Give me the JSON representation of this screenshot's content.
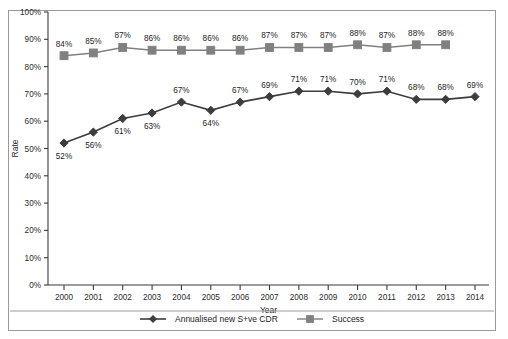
{
  "chart_data": {
    "type": "line",
    "title": "",
    "xlabel": "Year",
    "ylabel": "Rate",
    "categories": [
      "2000",
      "2001",
      "2002",
      "2003",
      "2004",
      "2005",
      "2006",
      "2007",
      "2008",
      "2009",
      "2010",
      "2011",
      "2012",
      "2013",
      "2014"
    ],
    "ylim": [
      0,
      100
    ],
    "ytick_labels": [
      "0%",
      "10%",
      "20%",
      "30%",
      "40%",
      "50%",
      "60%",
      "70%",
      "80%",
      "90%",
      "100%"
    ],
    "ytick_values": [
      0,
      10,
      20,
      30,
      40,
      50,
      60,
      70,
      80,
      90,
      100
    ],
    "grid": false,
    "legend_position": "bottom",
    "series": [
      {
        "name": "Annualised new S+ve CDR",
        "marker": "diamond",
        "color": "#3d3d3d",
        "values": [
          52,
          56,
          61,
          63,
          67,
          64,
          67,
          69,
          71,
          71,
          70,
          71,
          68,
          68,
          69
        ],
        "data_labels": [
          "52%",
          "56%",
          "61%",
          "63%",
          "67%",
          "64%",
          "67%",
          "69%",
          "71%",
          "71%",
          "70%",
          "71%",
          "68%",
          "68%",
          "69%"
        ],
        "label_placement": [
          "below",
          "below",
          "below",
          "below",
          "above",
          "below",
          "above",
          "above",
          "above",
          "above",
          "above",
          "above",
          "above",
          "above",
          "above"
        ]
      },
      {
        "name": "Success",
        "marker": "square",
        "color": "#808080",
        "values": [
          84,
          85,
          87,
          86,
          86,
          86,
          86,
          87,
          87,
          87,
          88,
          87,
          88,
          88,
          null
        ],
        "data_labels": [
          "84%",
          "85%",
          "87%",
          "86%",
          "86%",
          "86%",
          "86%",
          "87%",
          "87%",
          "87%",
          "88%",
          "87%",
          "88%",
          "88%",
          ""
        ],
        "label_placement": [
          "above",
          "above",
          "above",
          "above",
          "above",
          "above",
          "above",
          "above",
          "above",
          "above",
          "above",
          "above",
          "above",
          "above",
          ""
        ]
      }
    ]
  },
  "legend": {
    "entries": [
      {
        "label": "Annualised new S+ve CDR",
        "marker": "diamond",
        "color": "#3d3d3d"
      },
      {
        "label": "Success",
        "marker": "square",
        "color": "#808080"
      }
    ]
  },
  "axes": {
    "x_title": "Year",
    "y_title": "Rate"
  }
}
